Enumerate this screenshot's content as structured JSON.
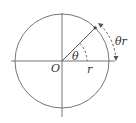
{
  "diagram": {
    "title": "",
    "labels": {
      "origin": "O",
      "angle": "θ",
      "radius": "r",
      "arc_length": "θr"
    },
    "colors": {
      "stroke": "#555555",
      "text": "#333333",
      "background": "#ffffff"
    }
  }
}
